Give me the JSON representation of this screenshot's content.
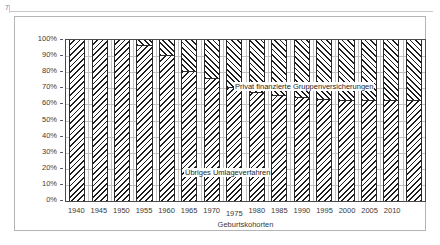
{
  "page_mark": "7",
  "chart_data": {
    "type": "bar",
    "subtype": "stacked-percentage",
    "title": "",
    "xlabel": "Geburtskohorten",
    "ylabel": "",
    "ylim": [
      0,
      100
    ],
    "y_unit": "%",
    "grid": true,
    "legend_position": "in-plot-annotations",
    "categories": [
      "1940",
      "1945",
      "1950",
      "1955",
      "1960",
      "1965",
      "1970",
      "1975",
      "1980",
      "1985",
      "1990",
      "1995",
      "2000",
      "2005",
      "2010",
      ""
    ],
    "x_tick_labels": [
      "1940",
      "1945",
      "1950",
      "1955",
      "1960",
      "1965",
      "1970",
      "1975",
      "1980",
      "1985",
      "1990",
      "1995",
      "2000",
      "2005",
      "2010"
    ],
    "y_tick_labels": [
      "100%",
      "90%",
      "80%",
      "70%",
      "60%",
      "50%",
      "40%",
      "30%",
      "20%",
      "10%",
      "0%"
    ],
    "y_tick_values": [
      100,
      90,
      80,
      70,
      60,
      50,
      40,
      30,
      20,
      10,
      0
    ],
    "series": [
      {
        "name": "Privat finanzierte Gruppenversicherungen",
        "pattern": "forward-diagonal-hatch",
        "values": [
          0,
          0,
          0,
          4,
          10,
          20,
          24,
          30,
          33,
          35,
          36,
          37,
          38,
          38,
          38,
          38
        ]
      },
      {
        "name": "Übriges Umlageverfahren",
        "pattern": "backward-diagonal-hatch",
        "values": [
          100,
          100,
          100,
          96,
          90,
          80,
          76,
          70,
          67,
          65,
          64,
          63,
          62,
          62,
          62,
          62
        ]
      }
    ],
    "annotations": [
      {
        "text": "Privat finanzierte Gruppenversicherungen",
        "series": "Privat finanzierte Gruppenversicherungen"
      },
      {
        "text": "Übriges Umlageverfahren",
        "series": "Übriges Umlageverfahren"
      }
    ]
  },
  "colors": {
    "hatch": "#1d1d1d",
    "background": "#ffffff",
    "gridline": "#c2c2c2",
    "axis": "#4a4a4a",
    "frame": "#b4b4b4",
    "text": "#3a3a3a"
  }
}
